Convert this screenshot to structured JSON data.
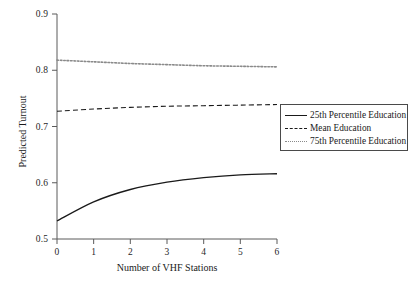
{
  "chart_data": {
    "type": "line",
    "title": "",
    "xlabel": "Number of VHF Stations",
    "ylabel": "Predicted Turnout",
    "xlim": [
      0,
      6
    ],
    "ylim": [
      0.5,
      0.9
    ],
    "xticks": [
      "0",
      "1",
      "2",
      "3",
      "4",
      "5",
      "6"
    ],
    "yticks": [
      "0.5",
      "0.6",
      "0.7",
      "0.8",
      "0.9"
    ],
    "grid": false,
    "legend_position": "right-middle",
    "x": [
      0,
      1,
      2,
      3,
      4,
      5,
      6
    ],
    "series": [
      {
        "name": "25th Percentile Education",
        "style": "solid",
        "color": "#1a1a1a",
        "values": [
          0.532,
          0.566,
          0.588,
          0.601,
          0.609,
          0.614,
          0.616
        ]
      },
      {
        "name": "Mean Education",
        "style": "dashed",
        "color": "#1a1a1a",
        "values": [
          0.727,
          0.731,
          0.734,
          0.736,
          0.737,
          0.738,
          0.739
        ]
      },
      {
        "name": "75th Percentile Education",
        "style": "dotted",
        "color": "#8a8a8a",
        "values": [
          0.818,
          0.815,
          0.812,
          0.81,
          0.808,
          0.807,
          0.806
        ]
      }
    ]
  },
  "axes": {
    "y_labels": [
      "0.9",
      "0.8",
      "0.7",
      "0.6",
      "0.5"
    ],
    "x_labels": [
      "0",
      "1",
      "2",
      "3",
      "4",
      "5",
      "6"
    ],
    "x_title": "Number of VHF Stations",
    "y_title": "Predicted Turnout"
  },
  "legend": {
    "items": [
      {
        "label": "25th Percentile Education"
      },
      {
        "label": "Mean Education"
      },
      {
        "label": "75th Percentile Education"
      }
    ]
  },
  "colors": {
    "axis": "#5a5a5a",
    "solid_line": "#1a1a1a",
    "dashed_line": "#1a1a1a",
    "dotted_line": "#8a8a8a",
    "background": "#ffffff"
  }
}
